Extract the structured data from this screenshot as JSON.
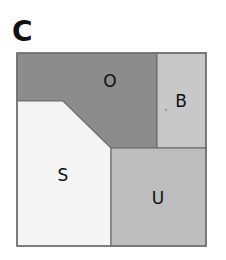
{
  "panel": {
    "label": "C"
  },
  "diagram": {
    "regions": [
      {
        "id": "O",
        "label": "O",
        "color": "#8c8c8c"
      },
      {
        "id": "B",
        "label": "B",
        "color": "#c8c8c8"
      },
      {
        "id": "S",
        "label": "S",
        "color": "#f4f4f4"
      },
      {
        "id": "U",
        "label": "U",
        "color": "#bdbdbd"
      }
    ],
    "border_color": "#6e6e6e"
  }
}
